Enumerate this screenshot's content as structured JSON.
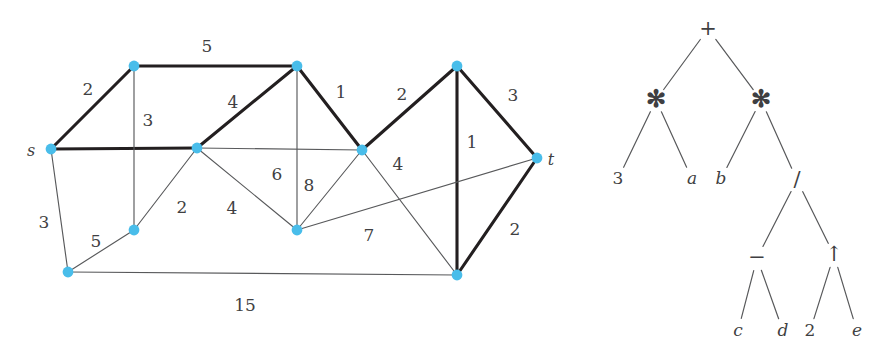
{
  "figure": {
    "background": "#ffffff",
    "node_color": "#49bdea",
    "bold_edge_color": "#231f20",
    "thin_edge_color": "#58595b",
    "label_color": "#3f3f42"
  },
  "graph": {
    "name": "weighted-undirected-graph",
    "source_label": "s",
    "sink_label": "t",
    "nodes": [
      {
        "id": "s",
        "x": 51,
        "y": 149,
        "label": "s"
      },
      {
        "id": "n1",
        "x": 134,
        "y": 66,
        "label": ""
      },
      {
        "id": "n2",
        "x": 297,
        "y": 66,
        "label": ""
      },
      {
        "id": "n3",
        "x": 197,
        "y": 148,
        "label": ""
      },
      {
        "id": "n4",
        "x": 362,
        "y": 150,
        "label": ""
      },
      {
        "id": "n5",
        "x": 457,
        "y": 66,
        "label": ""
      },
      {
        "id": "t",
        "x": 537,
        "y": 158,
        "label": "t"
      },
      {
        "id": "n6",
        "x": 134,
        "y": 230,
        "label": ""
      },
      {
        "id": "n7",
        "x": 297,
        "y": 230,
        "label": ""
      },
      {
        "id": "n8",
        "x": 68,
        "y": 272,
        "label": ""
      },
      {
        "id": "n9",
        "x": 457,
        "y": 275,
        "label": ""
      }
    ],
    "edges": [
      {
        "from": "s",
        "to": "n1",
        "weight": "2",
        "bold": true,
        "lx": 88,
        "ly": 90
      },
      {
        "from": "n1",
        "to": "n2",
        "weight": "5",
        "bold": true,
        "lx": 207,
        "ly": 47
      },
      {
        "from": "n3",
        "to": "n2",
        "weight": "4",
        "bold": true,
        "lx": 233,
        "ly": 103
      },
      {
        "from": "n2",
        "to": "n4",
        "weight": "1",
        "bold": true,
        "lx": 341,
        "ly": 93
      },
      {
        "from": "s",
        "to": "n3",
        "weight": "",
        "bold": true,
        "lx": 0,
        "ly": 0
      },
      {
        "from": "n4",
        "to": "n5",
        "weight": "2",
        "bold": true,
        "lx": 402,
        "ly": 95
      },
      {
        "from": "n5",
        "to": "t",
        "weight": "3",
        "bold": true,
        "lx": 513,
        "ly": 96
      },
      {
        "from": "n5",
        "to": "n9",
        "weight": "1",
        "bold": true,
        "lx": 472,
        "ly": 143
      },
      {
        "from": "n9",
        "to": "t",
        "weight": "2",
        "bold": true,
        "lx": 515,
        "ly": 230
      },
      {
        "from": "n1",
        "to": "n6",
        "weight": "3",
        "bold": false,
        "lx": 148,
        "ly": 121
      },
      {
        "from": "s",
        "to": "n8",
        "weight": "3",
        "bold": false,
        "lx": 44,
        "ly": 223
      },
      {
        "from": "n6",
        "to": "n8",
        "weight": "5",
        "bold": false,
        "lx": 96,
        "ly": 242
      },
      {
        "from": "n6",
        "to": "n3",
        "weight": "2",
        "bold": false,
        "lx": 182,
        "ly": 208
      },
      {
        "from": "n3",
        "to": "n7",
        "weight": "4",
        "bold": false,
        "lx": 232,
        "ly": 209
      },
      {
        "from": "n2",
        "to": "n7",
        "weight": "8",
        "bold": false,
        "lx": 309,
        "ly": 186
      },
      {
        "from": "n4",
        "to": "n7",
        "weight": "6",
        "bold": false,
        "lx": 277,
        "ly": 175
      },
      {
        "from": "n7",
        "to": "t",
        "weight": "7",
        "bold": false,
        "lx": 369,
        "ly": 236
      },
      {
        "from": "n4",
        "to": "n9",
        "weight": "4",
        "bold": false,
        "lx": 398,
        "ly": 165
      },
      {
        "from": "n8",
        "to": "n9",
        "weight": "15",
        "bold": false,
        "lx": 245,
        "ly": 306
      },
      {
        "from": "n3",
        "to": "n4",
        "weight": "",
        "bold": false,
        "lx": 0,
        "ly": 0
      }
    ],
    "weights_listed": [
      "2",
      "5",
      "4",
      "1",
      "2",
      "3",
      "1",
      "2",
      "3",
      "3",
      "5",
      "2",
      "4",
      "8",
      "6",
      "7",
      "4",
      "15"
    ]
  },
  "tree": {
    "name": "expression-tree",
    "expression": "3*a + b*((c-d)/(2^e))",
    "nodes": [
      {
        "id": "r",
        "x": 708,
        "y": 29,
        "label": "+",
        "kind": "operator"
      },
      {
        "id": "m1",
        "x": 656,
        "y": 100,
        "label": "✻",
        "kind": "operator"
      },
      {
        "id": "m2",
        "x": 761,
        "y": 100,
        "label": "✻",
        "kind": "operator"
      },
      {
        "id": "l3",
        "x": 618,
        "y": 179,
        "label": "3",
        "kind": "number"
      },
      {
        "id": "la",
        "x": 692,
        "y": 179,
        "label": "a",
        "kind": "variable"
      },
      {
        "id": "lb",
        "x": 721,
        "y": 179,
        "label": "b",
        "kind": "variable"
      },
      {
        "id": "div",
        "x": 797,
        "y": 180,
        "label": "/",
        "kind": "operator"
      },
      {
        "id": "sub",
        "x": 757,
        "y": 258,
        "label": "−",
        "kind": "operator"
      },
      {
        "id": "pow",
        "x": 834,
        "y": 255,
        "label": "↑",
        "kind": "operator"
      },
      {
        "id": "lc",
        "x": 738,
        "y": 331,
        "label": "c",
        "kind": "variable"
      },
      {
        "id": "ld",
        "x": 783,
        "y": 331,
        "label": "d",
        "kind": "variable"
      },
      {
        "id": "l2",
        "x": 810,
        "y": 331,
        "label": "2",
        "kind": "number"
      },
      {
        "id": "le",
        "x": 857,
        "y": 331,
        "label": "e",
        "kind": "variable"
      }
    ],
    "edges": [
      {
        "from": "r",
        "to": "m1"
      },
      {
        "from": "r",
        "to": "m2"
      },
      {
        "from": "m1",
        "to": "l3"
      },
      {
        "from": "m1",
        "to": "la"
      },
      {
        "from": "m2",
        "to": "lb"
      },
      {
        "from": "m2",
        "to": "div"
      },
      {
        "from": "div",
        "to": "sub"
      },
      {
        "from": "div",
        "to": "pow"
      },
      {
        "from": "sub",
        "to": "lc"
      },
      {
        "from": "sub",
        "to": "ld"
      },
      {
        "from": "pow",
        "to": "l2"
      },
      {
        "from": "pow",
        "to": "le"
      }
    ]
  }
}
